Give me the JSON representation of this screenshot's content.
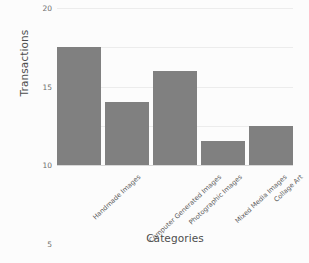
{
  "chart_data": {
    "type": "bar",
    "title": "",
    "xlabel": "Categories",
    "ylabel": "Transactions",
    "categories": [
      "Handmade Images",
      "Computer Generated Images",
      "Photographic Images",
      "Mixed Media Images",
      "Collage Art"
    ],
    "values": [
      15,
      8,
      12,
      3,
      5
    ],
    "ylim": [
      0,
      20
    ],
    "yticks": [
      0,
      5,
      10,
      15,
      20
    ],
    "ytick_labels": [
      "0",
      "5",
      "10",
      "15",
      "20"
    ],
    "grid": true,
    "legend": false,
    "legend_position": "none",
    "orientation": "vertical",
    "bar_color": "#808080",
    "background_color": "#fcfcfc",
    "grid_color": "#ececec",
    "text_color": "#4d4d4d"
  }
}
